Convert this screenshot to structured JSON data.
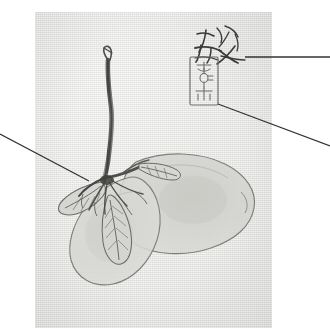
{
  "figure": {
    "type": "ink-painting-plate",
    "background_color": "#ffffff",
    "panel": {
      "paper_color": "#e4e4e2",
      "x": 35,
      "y": 12,
      "width": 237,
      "height": 316
    }
  },
  "caption": {
    "text": "ua)",
    "full_text_visible": "ua)",
    "style": "italic",
    "truncated_at_left_edge": true
  },
  "artwork": {
    "title_alt": "ink brush painting of an uprooted seedling with two large leaves",
    "subject": "uprooted plant seedling",
    "ink_color": "#5c5c5c",
    "dark_ink_color": "#3d3d3d",
    "wash_color": "#cfcfcc",
    "elements": [
      {
        "name": "upright-stem",
        "description": "tall dark brush stem rising to top"
      },
      {
        "name": "root-cluster",
        "description": "fine splayed roots at stem base"
      },
      {
        "name": "small-left-leaf",
        "description": "narrow veined leaf pointing left"
      },
      {
        "name": "small-center-leaf",
        "description": "narrow veined leaf hanging down"
      },
      {
        "name": "small-right-leaf",
        "description": "narrow veined leaf pointing right"
      },
      {
        "name": "large-left-leaf",
        "description": "broad pale wash leaf lower left"
      },
      {
        "name": "large-right-leaf",
        "description": "broad pale wash leaf lower right"
      }
    ]
  },
  "inscription": {
    "name": "calligraphic-signature",
    "script": "cursive brush characters",
    "x": 196,
    "y": 28,
    "width": 52,
    "height": 30
  },
  "seal": {
    "name": "artist-seal-stamp",
    "shape": "vertical-rectangle",
    "x": 190,
    "y": 57,
    "width": 28,
    "height": 48,
    "border_color": "#6b6b6b"
  },
  "annotations": {
    "leader_lines": [
      {
        "name": "leader-line-to-leaf",
        "from": {
          "x": 0,
          "y": 134
        },
        "to": {
          "x": 89,
          "y": 181
        },
        "target": "small-left-leaf",
        "side": "left"
      },
      {
        "name": "leader-line-to-signature",
        "from": {
          "x": 245,
          "y": 57
        },
        "to": {
          "x": 330,
          "y": 57
        },
        "target": "calligraphic-signature",
        "side": "right"
      },
      {
        "name": "leader-line-to-seal",
        "from": {
          "x": 218,
          "y": 104
        },
        "to": {
          "x": 330,
          "y": 146
        },
        "target": "artist-seal-stamp",
        "side": "right"
      }
    ],
    "line_color": "#333333",
    "line_width": 1.2
  }
}
